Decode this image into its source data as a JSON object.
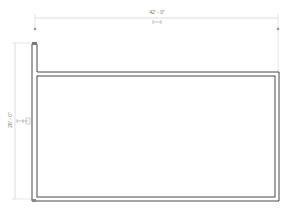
{
  "drawing": {
    "dimensions": {
      "horizontal": {
        "label": "42' - 0\"",
        "symbol": "EQ"
      },
      "vertical": {
        "label": "26' - 0\"",
        "symbol": "EQ"
      }
    },
    "colors": {
      "wall": "#333333",
      "dimension": "#bbbbbb",
      "grip": "#999999",
      "background": "#ffffff"
    }
  }
}
